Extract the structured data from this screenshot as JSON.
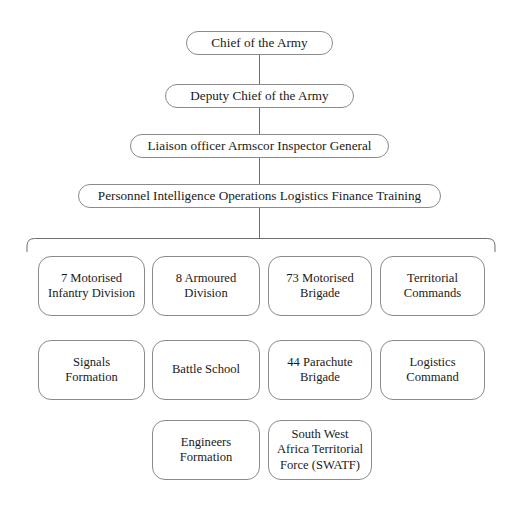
{
  "diagram": {
    "type": "organizational-chart",
    "title_text": "",
    "style": {
      "box_border_color": "#8a8a8a",
      "connector_color": "#6f6f6f",
      "text_color": "#1a1a1a",
      "background": "#ffffff"
    },
    "hierarchy": [
      {
        "level": 1,
        "label": "Chief of the Army"
      },
      {
        "level": 2,
        "label": "Deputy Chief of the Army"
      },
      {
        "level": 3,
        "label": "Liaison officer Armscor Inspector General"
      },
      {
        "level": 4,
        "label": "Personnel Intelligence Operations Logistics Finance Training"
      }
    ],
    "units": [
      {
        "id": "u1",
        "lines": [
          "7 Motorised",
          "Infantry Division"
        ],
        "row": 1,
        "col": 1
      },
      {
        "id": "u2",
        "lines": [
          "8 Armoured",
          "Division"
        ],
        "row": 1,
        "col": 2
      },
      {
        "id": "u3",
        "lines": [
          "73 Motorised",
          "Brigade"
        ],
        "row": 1,
        "col": 3
      },
      {
        "id": "u4",
        "lines": [
          "Territorial",
          "Commands"
        ],
        "row": 1,
        "col": 4
      },
      {
        "id": "u5",
        "lines": [
          "Signals",
          "Formation"
        ],
        "row": 2,
        "col": 1
      },
      {
        "id": "u6",
        "lines": [
          "Battle School"
        ],
        "row": 2,
        "col": 2
      },
      {
        "id": "u7",
        "lines": [
          "44 Parachute",
          "Brigade"
        ],
        "row": 2,
        "col": 3
      },
      {
        "id": "u8",
        "lines": [
          "Logistics",
          "Command"
        ],
        "row": 2,
        "col": 4
      },
      {
        "id": "u9",
        "lines": [
          "Engineers",
          "Formation"
        ],
        "row": 3,
        "col": 2
      },
      {
        "id": "u10",
        "lines": [
          "South West",
          "Africa Territorial",
          "Force (SWATF)"
        ],
        "row": 3,
        "col": 3
      }
    ]
  }
}
